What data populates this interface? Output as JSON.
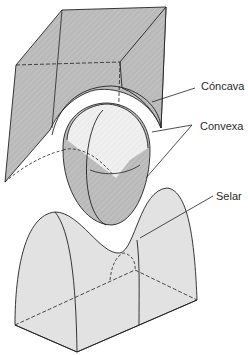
{
  "diagram": {
    "labels": {
      "concave": "Cóncava",
      "convex": "Convexa",
      "saddle": "Selar"
    },
    "colors": {
      "dark_fill": "#b8b8b8",
      "light_fill": "#dcdcdc",
      "sphere_highlight": "#f0f0f0",
      "stroke": "#222222"
    }
  }
}
